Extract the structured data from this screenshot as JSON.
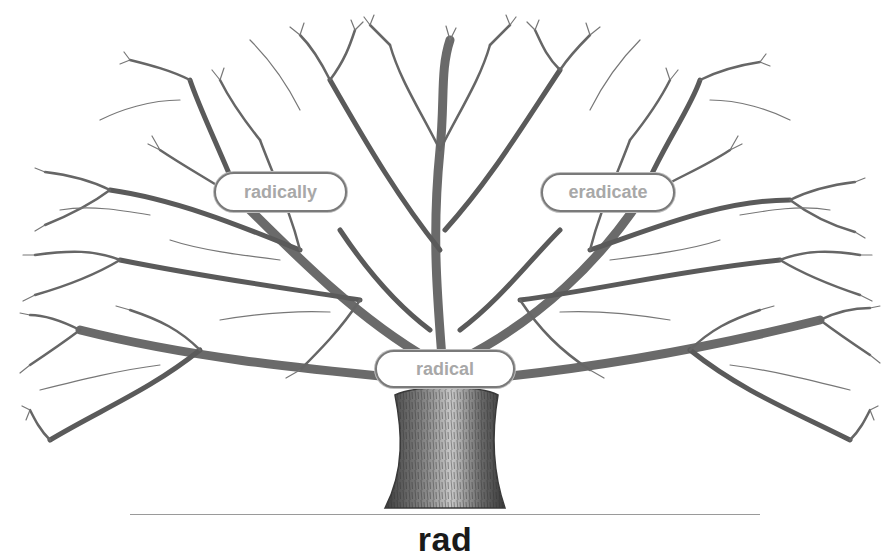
{
  "diagram": {
    "type": "word-tree",
    "root": {
      "label": "rad"
    },
    "nodes": [
      {
        "id": "radical",
        "label": "radical",
        "position": "trunk"
      },
      {
        "id": "radically",
        "label": "radically",
        "position": "upper-left-branch"
      },
      {
        "id": "eradicate",
        "label": "eradicate",
        "position": "upper-right-branch"
      }
    ],
    "colors": {
      "background": "#ffffff",
      "branches": "#5a5a5a",
      "node_text": "#a8a8a8",
      "node_border": "#7a7a7a",
      "root_text": "#1a1a1a"
    }
  }
}
